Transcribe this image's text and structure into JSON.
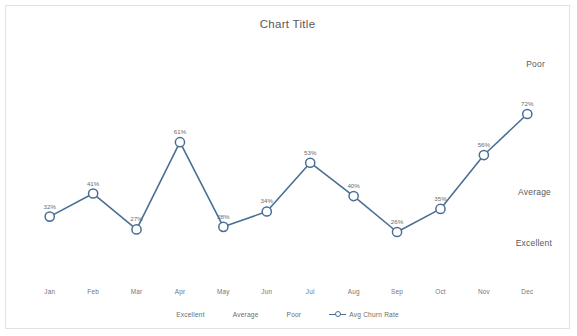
{
  "chart_data": {
    "type": "line",
    "title": "Chart Title",
    "xlabel": "",
    "ylabel": "",
    "ylim": [
      0,
      100
    ],
    "grid": false,
    "legend_position": "bottom",
    "categories": [
      "Jan",
      "Feb",
      "Mar",
      "Apr",
      "May",
      "Jun",
      "Jul",
      "Aug",
      "Sep",
      "Oct",
      "Nov",
      "Dec"
    ],
    "series": [
      {
        "name": "Avg Churn Rate",
        "color": "#4a6f94",
        "marker": "circle-open",
        "values": [
          32,
          41,
          27,
          61,
          28,
          34,
          53,
          40,
          26,
          35,
          56,
          72
        ],
        "data_labels": [
          "32%",
          "41%",
          "27%",
          "61%",
          "28%",
          "34%",
          "53%",
          "40%",
          "26%",
          "35%",
          "56%",
          "72%"
        ]
      }
    ],
    "band_annotations": [
      {
        "label": "Poor",
        "position": "right-top"
      },
      {
        "label": "Average",
        "position": "right-middle"
      },
      {
        "label": "Excellent",
        "position": "right-bottom"
      }
    ],
    "legend_entries": [
      {
        "label": "Excellent",
        "marker": "none"
      },
      {
        "label": "Average",
        "marker": "none"
      },
      {
        "label": "Poor",
        "marker": "none"
      },
      {
        "label": "Avg Churn Rate",
        "marker": "line-circle",
        "color": "#4a6f94"
      }
    ]
  },
  "colors": {
    "series": "#4a6f94",
    "text": "#58595b",
    "muted_text": "#6b6c6e",
    "border": "#e2e2e2",
    "background": "#ffffff"
  }
}
